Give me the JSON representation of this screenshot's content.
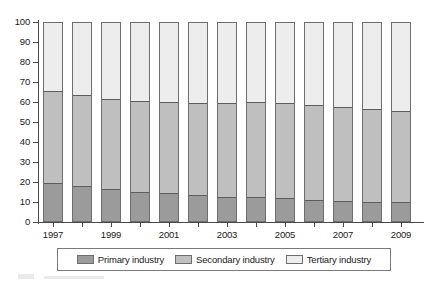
{
  "chart_data": {
    "type": "bar",
    "stacked": true,
    "title": "",
    "xlabel": "",
    "ylabel": "",
    "ylim": [
      0,
      100
    ],
    "yticks": [
      0,
      10,
      20,
      30,
      40,
      50,
      60,
      70,
      80,
      90,
      100
    ],
    "grid": false,
    "legend_position": "bottom",
    "categories": [
      "1997",
      "1998",
      "1999",
      "2000",
      "2001",
      "2002",
      "2003",
      "2004",
      "2005",
      "2006",
      "2007",
      "2008",
      "2009"
    ],
    "tick_labels": [
      "1997",
      "",
      "1999",
      "",
      "2001",
      "",
      "2003",
      "",
      "2005",
      "",
      "2007",
      "",
      "2009"
    ],
    "series": [
      {
        "name": "Primary industry",
        "color": "#9b9b9b",
        "values": [
          19,
          17.5,
          16,
          14.5,
          14,
          13,
          12,
          12,
          11.5,
          10.5,
          10,
          9.5,
          9.5
        ]
      },
      {
        "name": "Secondary industry",
        "color": "#bfbfbf",
        "values": [
          47,
          46.5,
          46,
          46.5,
          46.5,
          47,
          48,
          48.5,
          48.5,
          48.5,
          48,
          47.5,
          46.5
        ]
      },
      {
        "name": "Tertiary industry",
        "color": "#ededed",
        "values": [
          34,
          36,
          38,
          39,
          39.5,
          40,
          40,
          39.5,
          40,
          41,
          42,
          43,
          44
        ]
      }
    ],
    "cumulative_tops": {
      "primary": [
        19,
        17.5,
        16,
        14.5,
        14,
        13,
        12,
        12,
        11.5,
        10.5,
        10,
        9.5,
        9.5
      ],
      "secondary": [
        66,
        64,
        62,
        61,
        60.5,
        60,
        60,
        60.5,
        60,
        59,
        58,
        57,
        56
      ],
      "tertiary": [
        100,
        100,
        100,
        100,
        100,
        100,
        100,
        100,
        100,
        100,
        100,
        100,
        100
      ]
    }
  },
  "legend": {
    "items": [
      {
        "label": "Primary industry",
        "swatch": "primary"
      },
      {
        "label": "Secondary industry",
        "swatch": "secondary"
      },
      {
        "label": "Tertiary industry",
        "swatch": "tertiary"
      }
    ]
  },
  "axes": {
    "y_tick_labels": [
      "100",
      "90",
      "80",
      "70",
      "60",
      "50",
      "40",
      "30",
      "20",
      "10",
      "0"
    ],
    "x_tick_labels": [
      "1997",
      "1999",
      "2001",
      "2003",
      "2005",
      "2007",
      "2009"
    ]
  },
  "colors": {
    "primary": "#9b9b9b",
    "secondary": "#bfbfbf",
    "tertiary": "#ededed",
    "axis": "#4a4a4a",
    "bar_border": "#6e6e6e",
    "text": "#1a1a1a"
  }
}
